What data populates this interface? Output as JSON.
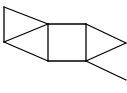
{
  "diagram": {
    "type": "skeletal-structure",
    "stroke_color": "#000000",
    "background": "#ffffff",
    "atoms": [
      {
        "id": "a1",
        "x": 4,
        "y": 7
      },
      {
        "id": "a2",
        "x": 4,
        "y": 42
      },
      {
        "id": "a3",
        "x": 48,
        "y": 24
      },
      {
        "id": "a4",
        "x": 48,
        "y": 61
      },
      {
        "id": "a5",
        "x": 86,
        "y": 24
      },
      {
        "id": "a6",
        "x": 86,
        "y": 61
      },
      {
        "id": "a7",
        "x": 126,
        "y": 43
      },
      {
        "id": "a8",
        "x": 126,
        "y": 80
      }
    ],
    "bonds": [
      [
        "a1",
        "a2"
      ],
      [
        "a1",
        "a3"
      ],
      [
        "a2",
        "a3"
      ],
      [
        "a2",
        "a4"
      ],
      [
        "a3",
        "a4"
      ],
      [
        "a3",
        "a5"
      ],
      [
        "a4",
        "a6"
      ],
      [
        "a5",
        "a6"
      ],
      [
        "a5",
        "a7"
      ],
      [
        "a6",
        "a7"
      ],
      [
        "a6",
        "a8"
      ]
    ]
  }
}
